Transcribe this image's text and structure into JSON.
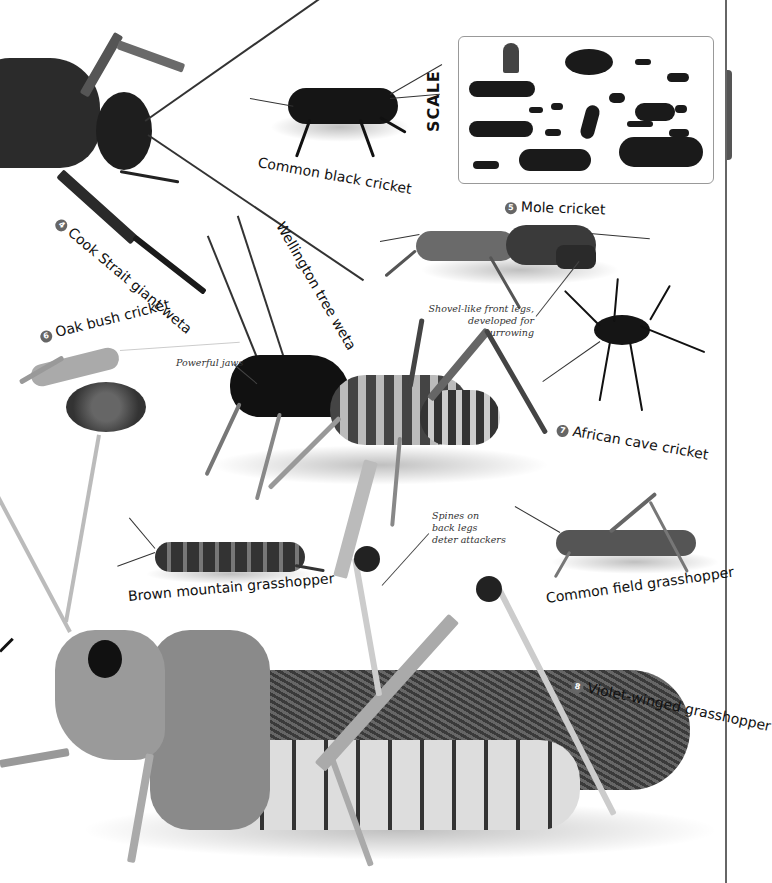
{
  "page": {
    "background": "#ffffff",
    "edge_rule_color": "#666666"
  },
  "scale": {
    "title": "SCALE",
    "icon": "insect-silhouettes-with-thumb"
  },
  "species": [
    {
      "number": "4",
      "name": "Cook Strait giant weta"
    },
    {
      "number": "",
      "name": "Common black cricket"
    },
    {
      "number": "5",
      "name": "Mole cricket"
    },
    {
      "number": "",
      "name": "Wellington tree weta"
    },
    {
      "number": "6",
      "name": "Oak bush cricket"
    },
    {
      "number": "7",
      "name": "African cave cricket"
    },
    {
      "number": "",
      "name": "Brown mountain grasshopper"
    },
    {
      "number": "",
      "name": "Common field grasshopper"
    },
    {
      "number": "8",
      "name": "Violet-winged grasshopper"
    }
  ],
  "annotations": {
    "mole_cricket": "Shovel-like front legs, developed for burrowing",
    "mole_cricket_line1": "Shovel-like front legs,",
    "mole_cricket_line2": "developed for burrowing",
    "tree_weta": "Powerful jaws",
    "violet_line1": "Spines on",
    "violet_line2": "back legs",
    "violet_line3": "deter attackers"
  }
}
